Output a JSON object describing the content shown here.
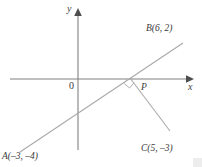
{
  "diagram": {
    "type": "cartesian-coordinate-geometry",
    "axes": {
      "x_label": "x",
      "y_label": "y",
      "origin_label": "0"
    },
    "points": [
      {
        "id": "A",
        "label": "A(–3, –4)",
        "x": -3,
        "y": -4
      },
      {
        "id": "B",
        "label": "B(6, 2)",
        "x": 6,
        "y": 2
      },
      {
        "id": "C",
        "label": "C(5, –3)",
        "x": 5,
        "y": -3
      },
      {
        "id": "P",
        "label": "P",
        "x": null,
        "y": 0
      }
    ],
    "segments": [
      {
        "id": "AB",
        "from": "A",
        "to": "B"
      },
      {
        "id": "PC",
        "from": "P",
        "to": "C"
      }
    ],
    "markers": [
      {
        "id": "right-angle-at-P",
        "kind": "right-angle",
        "at": "P"
      }
    ],
    "colors": {
      "axis": "#808080",
      "line": "#a8a8a8",
      "text": "#3a3a3a",
      "background": "#ffffff"
    }
  }
}
